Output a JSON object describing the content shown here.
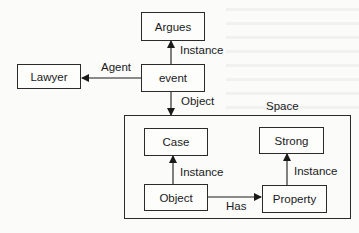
{
  "diagram": {
    "nodes": {
      "argues": "Argues",
      "event": "event",
      "lawyer": "Lawyer",
      "case": "Case",
      "object": "Object",
      "strong": "Strong",
      "property": "Property"
    },
    "container": {
      "label": "Space"
    },
    "edges": [
      {
        "from": "event",
        "to": "argues",
        "label": "Instance"
      },
      {
        "from": "event",
        "to": "lawyer",
        "label": "Agent"
      },
      {
        "from": "event",
        "to": "space",
        "label": "Object"
      },
      {
        "from": "object",
        "to": "case",
        "label": "Instance"
      },
      {
        "from": "object",
        "to": "property",
        "label": "Has"
      },
      {
        "from": "property",
        "to": "strong",
        "label": "Instance"
      }
    ]
  }
}
